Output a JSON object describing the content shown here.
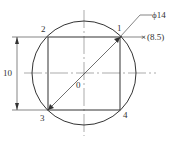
{
  "diagram": {
    "type": "technical-drawing",
    "colors": {
      "line": "#333333",
      "centerline": "#777777",
      "background": "#ffffff"
    },
    "labels": {
      "vertex_1": "1",
      "vertex_2": "2",
      "vertex_3": "3",
      "vertex_4": "4",
      "center": "0",
      "diameter": "ϕ14",
      "offset": "(8.5)",
      "height_dim": "10"
    }
  }
}
